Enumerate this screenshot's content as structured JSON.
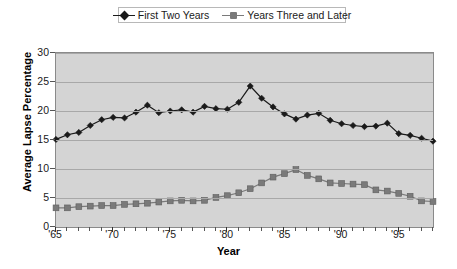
{
  "chart_data": {
    "type": "line",
    "title": "",
    "xlabel": "Year",
    "ylabel": "Average Lapse Percentage",
    "xlim": [
      1965,
      1998
    ],
    "ylim": [
      0,
      30
    ],
    "ytick_labels": [
      "0",
      "5",
      "10",
      "15",
      "20",
      "25",
      "30"
    ],
    "ytick_values": [
      0,
      5,
      10,
      15,
      20,
      25,
      30
    ],
    "xtick_labels": [
      "'65",
      "'70",
      "'75",
      "'80",
      "'85",
      "'90",
      "'95"
    ],
    "xtick_values": [
      1965,
      1970,
      1975,
      1980,
      1985,
      1990,
      1995
    ],
    "grid": true,
    "legend_position": "top-center",
    "x": [
      1965,
      1966,
      1967,
      1968,
      1969,
      1970,
      1971,
      1972,
      1973,
      1974,
      1975,
      1976,
      1977,
      1978,
      1979,
      1980,
      1981,
      1982,
      1983,
      1984,
      1985,
      1986,
      1987,
      1988,
      1989,
      1990,
      1991,
      1992,
      1993,
      1994,
      1995,
      1996,
      1997,
      1998
    ],
    "series": [
      {
        "name": "First Two Years",
        "marker": "diamond",
        "color": "#1a1a1a",
        "values": [
          15.1,
          15.9,
          16.3,
          17.5,
          18.5,
          18.9,
          18.8,
          19.8,
          21.0,
          19.7,
          20.0,
          20.2,
          19.8,
          20.8,
          20.4,
          20.3,
          21.5,
          24.3,
          22.2,
          20.7,
          19.5,
          18.6,
          19.3,
          19.6,
          18.4,
          17.8,
          17.5,
          17.3,
          17.4,
          17.9,
          16.1,
          15.8,
          15.3,
          14.8
        ]
      },
      {
        "name": "Years Three and Later",
        "marker": "square",
        "color": "#7a7a7a",
        "values": [
          3.3,
          3.3,
          3.5,
          3.6,
          3.7,
          3.7,
          3.9,
          4.0,
          4.1,
          4.3,
          4.5,
          4.6,
          4.5,
          4.6,
          5.1,
          5.4,
          5.9,
          6.6,
          7.6,
          8.6,
          9.2,
          9.9,
          8.9,
          8.3,
          7.6,
          7.5,
          7.4,
          7.3,
          6.4,
          6.2,
          5.8,
          5.3,
          4.5,
          4.4
        ]
      }
    ]
  },
  "legend": {
    "entries": [
      {
        "label": "First Two Years"
      },
      {
        "label": "Years Three and Later"
      }
    ]
  },
  "axes": {
    "x_title": "Year",
    "y_title": "Average Lapse Percentage"
  }
}
